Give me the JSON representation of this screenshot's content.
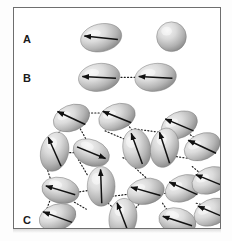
{
  "figure": {
    "background_color": "#ffffff",
    "frame_border_color": "#6e6e6e",
    "particle_fill_light": "#e8e8e8",
    "particle_fill_mid": "#b9b9b9",
    "particle_fill_dark": "#8d8d8d",
    "arrow_color": "#111111",
    "bond_color": "#1a1a1a"
  },
  "panels": [
    {
      "id": "A",
      "label": "A"
    },
    {
      "id": "B",
      "label": "B"
    },
    {
      "id": "C",
      "label": "C"
    }
  ],
  "panel_labels": {
    "a": "A",
    "b": "B",
    "c": "C"
  },
  "panel_a": {
    "label": "A",
    "particles": [
      {
        "name": "ellipsoid-with-dipole",
        "cx": 88,
        "cy": 30,
        "rx": 21,
        "ry": 14,
        "rotation": -12,
        "arrow_angle": 186,
        "arrow_length": 34,
        "has_arrow": true
      },
      {
        "name": "plain-sphere",
        "cx": 159,
        "cy": 29,
        "rx": 15,
        "ry": 15,
        "rotation": 0,
        "arrow_angle": 0,
        "arrow_length": 0,
        "has_arrow": false
      }
    ]
  },
  "panel_b": {
    "label": "B",
    "particles": [
      {
        "name": "ellipsoid-with-dipole",
        "cx": 86,
        "cy": 70,
        "rx": 21,
        "ry": 14,
        "rotation": -8,
        "arrow_angle": 183,
        "arrow_length": 34,
        "has_arrow": true
      },
      {
        "name": "ellipsoid-with-dipole",
        "cx": 143,
        "cy": 70,
        "rx": 21,
        "ry": 14,
        "rotation": -8,
        "arrow_angle": 183,
        "arrow_length": 34,
        "has_arrow": true
      }
    ],
    "bonds": [
      {
        "name": "dipole-bond",
        "x1": 108,
        "y1": 70,
        "x2": 122,
        "y2": 70
      }
    ]
  },
  "panel_c": {
    "label": "C",
    "particles": [
      {
        "id": 1,
        "cx": 58,
        "cy": 111,
        "rx": 19,
        "ry": 13,
        "rotation": -22,
        "arrow_angle": 205,
        "arrow_length": 31
      },
      {
        "id": 2,
        "cx": 104,
        "cy": 110,
        "rx": 19,
        "ry": 13,
        "rotation": -20,
        "arrow_angle": 202,
        "arrow_length": 31
      },
      {
        "id": 3,
        "cx": 167,
        "cy": 118,
        "rx": 19,
        "ry": 13,
        "rotation": -24,
        "arrow_angle": 203,
        "arrow_length": 31
      },
      {
        "id": 4,
        "cx": 41,
        "cy": 145,
        "rx": 14,
        "ry": 20,
        "rotation": 14,
        "arrow_angle": 246,
        "arrow_length": 32
      },
      {
        "id": 5,
        "cx": 78,
        "cy": 146,
        "rx": 19,
        "ry": 13,
        "rotation": 22,
        "arrow_angle": 22,
        "arrow_length": 31
      },
      {
        "id": 6,
        "cx": 124,
        "cy": 142,
        "rx": 14,
        "ry": 20,
        "rotation": -10,
        "arrow_angle": 250,
        "arrow_length": 33
      },
      {
        "id": 7,
        "cx": 152,
        "cy": 141,
        "rx": 14,
        "ry": 20,
        "rotation": 12,
        "arrow_angle": 252,
        "arrow_length": 33
      },
      {
        "id": 8,
        "cx": 190,
        "cy": 140,
        "rx": 19,
        "ry": 13,
        "rotation": -25,
        "arrow_angle": 205,
        "arrow_length": 31
      },
      {
        "id": 9,
        "cx": 88,
        "cy": 180,
        "rx": 14,
        "ry": 20,
        "rotation": 0,
        "arrow_angle": 268,
        "arrow_length": 34
      },
      {
        "id": 10,
        "cx": 47,
        "cy": 184,
        "rx": 19,
        "ry": 13,
        "rotation": 12,
        "arrow_angle": 197,
        "arrow_length": 31
      },
      {
        "id": 11,
        "cx": 133,
        "cy": 185,
        "rx": 19,
        "ry": 13,
        "rotation": -12,
        "arrow_angle": 196,
        "arrow_length": 31
      },
      {
        "id": 12,
        "cx": 171,
        "cy": 182,
        "rx": 19,
        "ry": 13,
        "rotation": -22,
        "arrow_angle": 204,
        "arrow_length": 31
      },
      {
        "id": 13,
        "cx": 198,
        "cy": 174,
        "rx": 19,
        "ry": 13,
        "rotation": -22,
        "arrow_angle": 202,
        "arrow_length": 31
      },
      {
        "id": 14,
        "cx": 44,
        "cy": 211,
        "rx": 19,
        "ry": 13,
        "rotation": -18,
        "arrow_angle": 200,
        "arrow_length": 31
      },
      {
        "id": 15,
        "cx": 110,
        "cy": 212,
        "rx": 14,
        "ry": 20,
        "rotation": 8,
        "arrow_angle": 249,
        "arrow_length": 33
      },
      {
        "id": 16,
        "cx": 165,
        "cy": 215,
        "rx": 19,
        "ry": 13,
        "rotation": 14,
        "arrow_angle": 198,
        "arrow_length": 31
      },
      {
        "id": 17,
        "cx": 200,
        "cy": 206,
        "rx": 19,
        "ry": 13,
        "rotation": -24,
        "arrow_angle": 203,
        "arrow_length": 31
      }
    ],
    "bonds": [
      {
        "x1": 75,
        "y1": 106,
        "x2": 88,
        "y2": 106
      },
      {
        "x1": 48,
        "y1": 123,
        "x2": 38,
        "y2": 133
      },
      {
        "x1": 67,
        "y1": 122,
        "x2": 73,
        "y2": 133
      },
      {
        "x1": 53,
        "y1": 146,
        "x2": 64,
        "y2": 146
      },
      {
        "x1": 92,
        "y1": 124,
        "x2": 113,
        "y2": 133
      },
      {
        "x1": 122,
        "y1": 122,
        "x2": 151,
        "y2": 126
      },
      {
        "x1": 159,
        "y1": 128,
        "x2": 166,
        "y2": 133
      },
      {
        "x1": 178,
        "y1": 128,
        "x2": 186,
        "y2": 133
      },
      {
        "x1": 110,
        "y1": 151,
        "x2": 120,
        "y2": 156
      },
      {
        "x1": 138,
        "y1": 147,
        "x2": 146,
        "y2": 147
      },
      {
        "x1": 164,
        "y1": 150,
        "x2": 178,
        "y2": 152
      },
      {
        "x1": 33,
        "y1": 161,
        "x2": 37,
        "y2": 173
      },
      {
        "x1": 65,
        "y1": 153,
        "x2": 75,
        "y2": 170
      },
      {
        "x1": 63,
        "y1": 186,
        "x2": 76,
        "y2": 184
      },
      {
        "x1": 36,
        "y1": 195,
        "x2": 33,
        "y2": 203
      },
      {
        "x1": 61,
        "y1": 196,
        "x2": 73,
        "y2": 203
      },
      {
        "x1": 99,
        "y1": 190,
        "x2": 115,
        "y2": 188
      },
      {
        "x1": 95,
        "y1": 197,
        "x2": 103,
        "y2": 204
      },
      {
        "x1": 121,
        "y1": 204,
        "x2": 128,
        "y2": 196
      },
      {
        "x1": 149,
        "y1": 188,
        "x2": 157,
        "y2": 186
      },
      {
        "x1": 186,
        "y1": 177,
        "x2": 192,
        "y2": 180
      },
      {
        "x1": 150,
        "y1": 197,
        "x2": 156,
        "y2": 206
      },
      {
        "x1": 184,
        "y1": 197,
        "x2": 192,
        "y2": 199
      },
      {
        "x1": 133,
        "y1": 171,
        "x2": 122,
        "y2": 161
      },
      {
        "x1": 108,
        "y1": 110,
        "x2": 120,
        "y2": 124
      },
      {
        "x1": 180,
        "y1": 160,
        "x2": 186,
        "y2": 165
      }
    ]
  },
  "chart_data": {
    "type": "diagram",
    "title": "",
    "description_panels": 3,
    "particle_counts": {
      "panel_a": 2,
      "panel_b": 2,
      "panel_c": 17
    },
    "bond_counts": {
      "panel_a": 0,
      "panel_b": 1,
      "panel_c": 26
    }
  }
}
